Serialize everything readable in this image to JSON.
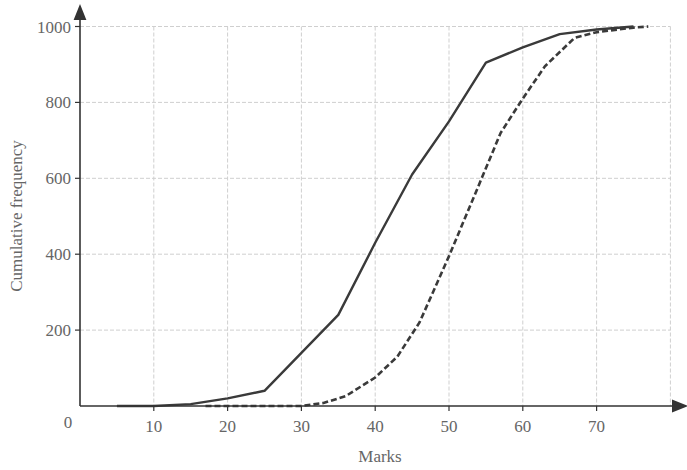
{
  "chart_data": {
    "type": "line",
    "title": "",
    "xlabel": "Marks",
    "ylabel": "Cumulative frequency",
    "xlim": [
      0,
      80
    ],
    "ylim": [
      0,
      1000
    ],
    "x_ticks": [
      10,
      20,
      30,
      40,
      50,
      60,
      70
    ],
    "y_ticks": [
      200,
      400,
      600,
      800,
      1000
    ],
    "origin_label": "0",
    "grid": true,
    "legend": null,
    "series": [
      {
        "name": "solid",
        "style": "solid",
        "points": [
          [
            5,
            0
          ],
          [
            10,
            0
          ],
          [
            15,
            5
          ],
          [
            20,
            20
          ],
          [
            25,
            40
          ],
          [
            30,
            140
          ],
          [
            35,
            240
          ],
          [
            40,
            430
          ],
          [
            45,
            610
          ],
          [
            50,
            750
          ],
          [
            55,
            905
          ],
          [
            60,
            945
          ],
          [
            65,
            980
          ],
          [
            70,
            992
          ],
          [
            75,
            1000
          ]
        ]
      },
      {
        "name": "dashed",
        "style": "dashed",
        "points": [
          [
            17,
            0
          ],
          [
            20,
            0
          ],
          [
            25,
            0
          ],
          [
            30,
            0
          ],
          [
            33,
            8
          ],
          [
            36,
            26
          ],
          [
            40,
            75
          ],
          [
            43,
            130
          ],
          [
            46,
            220
          ],
          [
            50,
            395
          ],
          [
            54,
            580
          ],
          [
            57,
            720
          ],
          [
            60,
            810
          ],
          [
            63,
            895
          ],
          [
            67,
            970
          ],
          [
            70,
            985
          ],
          [
            75,
            997
          ],
          [
            77,
            1000
          ]
        ]
      }
    ]
  }
}
